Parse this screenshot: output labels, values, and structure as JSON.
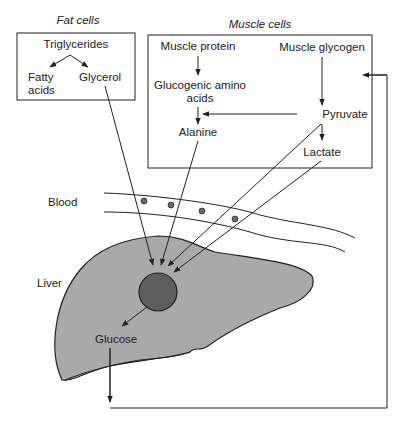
{
  "fat_cells": {
    "title": "Fat cells",
    "triglycerides": "Triglycerides",
    "fatty_acids_1": "Fatty",
    "fatty_acids_2": "acids",
    "glycerol": "Glycerol"
  },
  "muscle_cells": {
    "title": "Muscle cells",
    "muscle_protein": "Muscle protein",
    "muscle_glycogen": "Muscle glycogen",
    "glucogenic_1": "Glucogenic amino",
    "glucogenic_2": "acids",
    "alanine": "Alanine",
    "pyruvate": "Pyruvate",
    "lactate": "Lactate"
  },
  "blood_label": "Blood",
  "liver_label": "Liver",
  "glucose_label": "Glucose",
  "colors": {
    "liver_fill": "#a9a9a9",
    "hepatocyte_fill": "#5e5e5e",
    "line": "#222222",
    "background": "#ffffff"
  }
}
